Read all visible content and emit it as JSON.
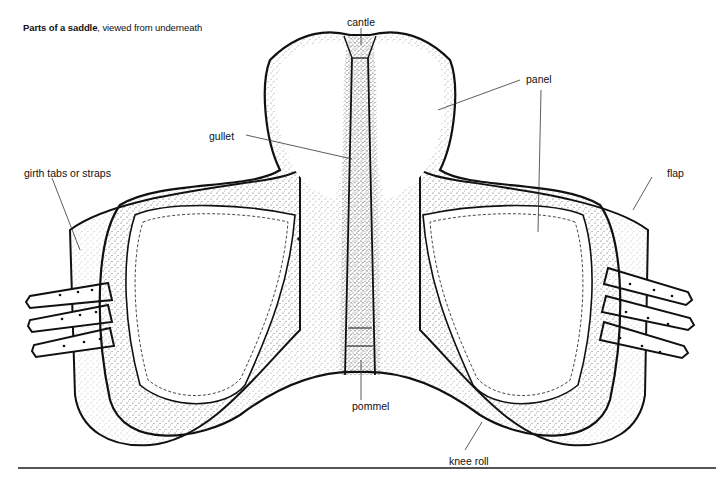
{
  "caption": {
    "bold": "Parts of a saddle",
    "rest": ", viewed from underneath"
  },
  "labels": {
    "cantle": "cantle",
    "panel": "panel",
    "gullet": "gullet",
    "girth": "girth tabs or straps",
    "flap": "flap",
    "pommel": "pommel",
    "knee_roll": "knee roll"
  },
  "colors": {
    "ink": "#111111",
    "stipple": "#333333",
    "rule": "#555555",
    "background": "#ffffff"
  }
}
